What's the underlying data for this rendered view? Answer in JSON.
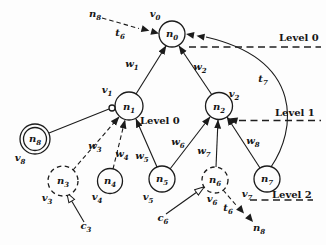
{
  "figure": {
    "background": "#fdfdfd",
    "ink": "#1b1b1b",
    "kind": "leveled task graph"
  },
  "nodes": {
    "n0": {
      "label": {
        "base": "n",
        "sub": "0"
      },
      "vertex": {
        "base": "v",
        "sub": "0"
      },
      "outline": "solid"
    },
    "n1": {
      "label": {
        "base": "n",
        "sub": "1"
      },
      "vertex": {
        "base": "v",
        "sub": "1"
      },
      "outline": "solid"
    },
    "n2": {
      "label": {
        "base": "n",
        "sub": "2"
      },
      "vertex": {
        "base": "v",
        "sub": "2"
      },
      "outline": "solid"
    },
    "n3": {
      "label": {
        "base": "n",
        "sub": "3"
      },
      "vertex": {
        "base": "v",
        "sub": "3"
      },
      "outline": "dashed"
    },
    "n4": {
      "label": {
        "base": "n",
        "sub": "4"
      },
      "vertex": {
        "base": "v",
        "sub": "4"
      },
      "outline": "solid"
    },
    "n5": {
      "label": {
        "base": "n",
        "sub": "5"
      },
      "vertex": {
        "base": "v",
        "sub": "5"
      },
      "outline": "solid"
    },
    "n6": {
      "label": {
        "base": "n",
        "sub": "6"
      },
      "vertex": {
        "base": "v",
        "sub": "6"
      },
      "outline": "dashed"
    },
    "n7": {
      "label": {
        "base": "n",
        "sub": "7"
      },
      "vertex": {
        "base": "v",
        "sub": "7"
      },
      "outline": "solid"
    },
    "n8": {
      "label": {
        "base": "n",
        "sub": "8"
      },
      "vertex": {
        "base": "v",
        "sub": "8"
      },
      "outline": "double"
    }
  },
  "edge_labels": {
    "w1": {
      "base": "w",
      "sub": "1"
    },
    "w2": {
      "base": "w",
      "sub": "2"
    },
    "w3": {
      "base": "w",
      "sub": "3"
    },
    "w4": {
      "base": "w",
      "sub": "4"
    },
    "w5": {
      "base": "w",
      "sub": "5"
    },
    "w6": {
      "base": "w",
      "sub": "6"
    },
    "w7": {
      "base": "w",
      "sub": "7"
    },
    "w8": {
      "base": "w",
      "sub": "8"
    }
  },
  "arrow_labels": {
    "t6_top": {
      "base": "t",
      "sub": "6"
    },
    "t7": {
      "base": "t",
      "sub": "7"
    },
    "t6_bottom": {
      "base": "t",
      "sub": "6"
    },
    "c3": {
      "base": "c",
      "sub": "3"
    },
    "c6": {
      "base": "c",
      "sub": "6"
    }
  },
  "external_refs": {
    "n8_top": {
      "base": "n",
      "sub": "8"
    },
    "n8_bottom": {
      "base": "n",
      "sub": "8"
    }
  },
  "level_labels": {
    "level0_right": "Level 0",
    "level0_mid": "Level 0",
    "level1": "Level 1",
    "level2": "Level 2"
  }
}
